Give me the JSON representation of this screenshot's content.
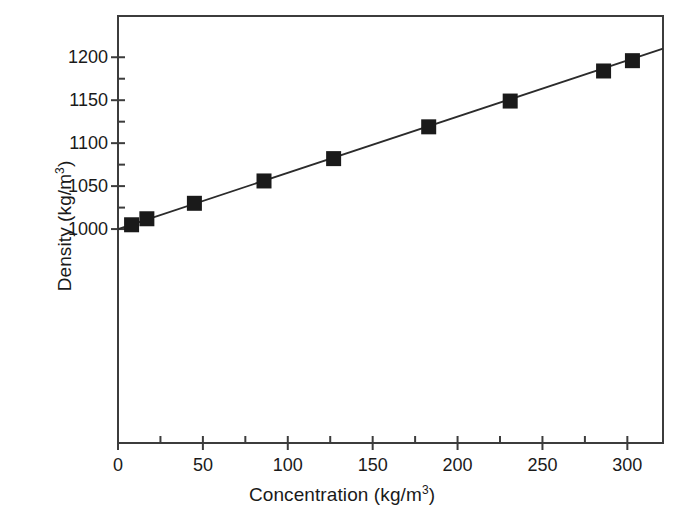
{
  "chart_data": {
    "type": "scatter",
    "title": "",
    "xlabel": "Concentration (kg/m3)",
    "xlabel_base": "Concentration (kg/m",
    "xlabel_sup": "3",
    "xlabel_tail": ")",
    "ylabel": "Density (kg/m3)",
    "ylabel_base": "Density (kg/m",
    "ylabel_sup": "3",
    "ylabel_tail": ")",
    "xlim": [
      0,
      321
    ],
    "ylim": [
      751,
      1248
    ],
    "xticks": [
      0,
      50,
      100,
      150,
      200,
      250,
      300
    ],
    "xticklabels": [
      "0",
      "50",
      "100",
      "150",
      "200",
      "250",
      "300"
    ],
    "xminorticks": [
      25,
      75,
      125,
      175,
      225,
      275
    ],
    "yticks": [
      1000,
      1050,
      1100,
      1150,
      1200
    ],
    "yticklabels": [
      "1000",
      "1050",
      "1100",
      "1150",
      "1200"
    ],
    "yminorticks": [
      1025,
      1075,
      1125,
      1175
    ],
    "grid": false,
    "legend": "none",
    "marker": "square",
    "marker_color": "#1a1a1a",
    "line_color": "#2b2b2b",
    "x": [
      8,
      17,
      45,
      86,
      127,
      183,
      231,
      286,
      303
    ],
    "y": [
      1005,
      1012,
      1030,
      1056,
      1082,
      1119,
      1149,
      1184,
      1196
    ],
    "fit_line": {
      "x": [
        0,
        321
      ],
      "y": [
        1000,
        1210
      ]
    },
    "points": [
      {
        "x": 8,
        "y": 1005
      },
      {
        "x": 17,
        "y": 1012
      },
      {
        "x": 45,
        "y": 1030
      },
      {
        "x": 86,
        "y": 1056
      },
      {
        "x": 127,
        "y": 1082
      },
      {
        "x": 183,
        "y": 1119
      },
      {
        "x": 231,
        "y": 1149
      },
      {
        "x": 286,
        "y": 1184
      },
      {
        "x": 303,
        "y": 1196
      }
    ]
  },
  "axes": {
    "frame_color": "#3c3c3c"
  }
}
